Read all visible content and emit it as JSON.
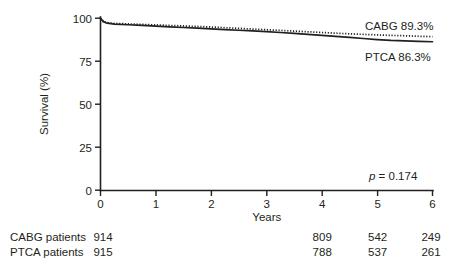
{
  "chart_data": {
    "type": "line",
    "title": "",
    "xlabel": "Years",
    "ylabel": "Survival (%)",
    "xlim": [
      0,
      6
    ],
    "ylim": [
      0,
      100
    ],
    "grid": false,
    "x_ticks": [
      "0",
      "1",
      "2",
      "3",
      "4",
      "5",
      "6"
    ],
    "y_ticks": [
      "0",
      "25",
      "50",
      "75",
      "100"
    ],
    "legend_position": "inline-right",
    "annotations": {
      "p_symbol": "p",
      "p_equals": " = 0.174",
      "p_value_full": "p = 0.174"
    },
    "series": [
      {
        "name": "CABG",
        "style": "dotted",
        "end_label": "CABG 89.3%",
        "final_value": 89.3,
        "x": [
          0,
          0.05,
          0.12,
          0.25,
          0.5,
          0.75,
          1.0,
          1.25,
          1.5,
          1.75,
          2.0,
          2.25,
          2.5,
          2.75,
          3.0,
          3.25,
          3.5,
          3.75,
          4.0,
          4.25,
          4.5,
          4.75,
          5.0,
          5.25,
          5.5,
          5.75,
          6.0
        ],
        "values": [
          100,
          98.2,
          97.4,
          97.0,
          96.7,
          96.4,
          96.1,
          95.8,
          95.5,
          95.2,
          94.9,
          94.5,
          94.1,
          93.7,
          93.3,
          92.9,
          92.5,
          92.1,
          91.7,
          91.3,
          90.9,
          90.6,
          90.3,
          90.0,
          89.8,
          89.5,
          89.3
        ]
      },
      {
        "name": "PTCA",
        "style": "solid",
        "end_label": "PTCA 86.3%",
        "final_value": 86.3,
        "x": [
          0,
          0.05,
          0.12,
          0.25,
          0.5,
          0.75,
          1.0,
          1.25,
          1.5,
          1.75,
          2.0,
          2.25,
          2.5,
          2.75,
          3.0,
          3.25,
          3.5,
          3.75,
          4.0,
          4.25,
          4.5,
          4.75,
          5.0,
          5.25,
          5.5,
          5.75,
          6.0
        ],
        "values": [
          100,
          98.0,
          97.1,
          96.6,
          96.2,
          95.8,
          95.4,
          95.0,
          94.6,
          94.2,
          93.8,
          93.4,
          93.0,
          92.6,
          92.2,
          91.7,
          91.2,
          90.6,
          90.0,
          89.4,
          88.8,
          88.2,
          87.6,
          87.1,
          86.8,
          86.5,
          86.3
        ]
      }
    ]
  },
  "risk_table": {
    "columns": [
      "0",
      "4",
      "5",
      "6"
    ],
    "column_years": [
      0,
      4,
      5,
      6
    ],
    "rows": [
      {
        "label": "CABG patients",
        "values": [
          "914",
          "",
          "",
          "",
          "809",
          "542",
          "249"
        ]
      },
      {
        "label": "PTCA patients",
        "values": [
          "915",
          "",
          "",
          "",
          "788",
          "537",
          "261"
        ]
      }
    ]
  },
  "colors": {
    "ink": "#231f20",
    "background": "#ffffff"
  }
}
